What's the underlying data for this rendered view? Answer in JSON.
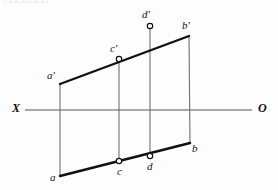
{
  "figure": {
    "title_fragment": "□□□□□□□",
    "axis": {
      "left_label": "X",
      "right_label": "O",
      "line_y": 110,
      "line_x_start": 25,
      "line_x_end": 252,
      "color": "#555555"
    },
    "colors": {
      "heavy_line": "#111111",
      "thin_line": "#6f6f6f",
      "axis_line": "#555555",
      "marker_stroke": "#111111",
      "marker_fill": "#ffffff",
      "background": "#fdfdfd",
      "label_text": "#111111"
    },
    "points": [
      {
        "id": "a-prime",
        "label": "a'",
        "x": 60,
        "y": 84,
        "marker": "none",
        "label_x": 47,
        "label_y": 70
      },
      {
        "id": "b-prime",
        "label": "b'",
        "x": 189,
        "y": 36,
        "marker": "none",
        "label_x": 182,
        "label_y": 20
      },
      {
        "id": "c-prime",
        "label": "c'",
        "x": 119,
        "y": 59,
        "marker": "circle",
        "label_x": 110,
        "label_y": 43
      },
      {
        "id": "d-prime",
        "label": "d'",
        "x": 150,
        "y": 26,
        "marker": "circle",
        "label_x": 142,
        "label_y": 9
      },
      {
        "id": "a",
        "label": "a",
        "x": 60,
        "y": 176,
        "marker": "none",
        "label_x": 50,
        "label_y": 172
      },
      {
        "id": "b",
        "label": "b",
        "x": 190,
        "y": 143,
        "marker": "none",
        "label_x": 192,
        "label_y": 143
      },
      {
        "id": "c",
        "label": "c",
        "x": 119,
        "y": 161,
        "marker": "circle",
        "label_x": 117,
        "label_y": 166
      },
      {
        "id": "d",
        "label": "d",
        "x": 150,
        "y": 156,
        "marker": "circle",
        "label_x": 147,
        "label_y": 161
      }
    ],
    "heavy_segments": [
      {
        "id": "segment-a-prime-b-prime",
        "x1": 60,
        "y1": 84,
        "x2": 189,
        "y2": 36
      },
      {
        "id": "segment-a-b",
        "x1": 60,
        "y1": 176,
        "x2": 190,
        "y2": 143
      }
    ],
    "thin_segments": [
      {
        "id": "projector-a",
        "x1": 60,
        "y1": 84,
        "x2": 60,
        "y2": 176
      },
      {
        "id": "projector-b",
        "x1": 189,
        "y1": 36,
        "x2": 190,
        "y2": 143
      },
      {
        "id": "projector-c",
        "x1": 119,
        "y1": 59,
        "x2": 119,
        "y2": 161
      },
      {
        "id": "projector-d",
        "x1": 150,
        "y1": 26,
        "x2": 150,
        "y2": 156
      }
    ]
  }
}
